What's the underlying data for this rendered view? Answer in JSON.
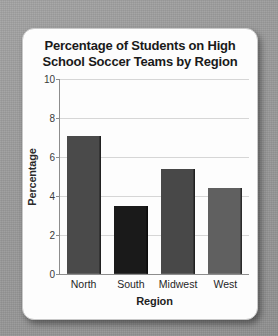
{
  "chart_data": {
    "type": "bar",
    "title": "Percentage of Students on High School Soccer Teams by Region",
    "title_lines": [
      "Percentage of Students on High",
      "School Soccer Teams by Region"
    ],
    "categories": [
      "North",
      "South",
      "Midwest",
      "West"
    ],
    "values": [
      7.1,
      3.5,
      5.4,
      4.4
    ],
    "bar_colors": [
      "#4a4a4a",
      "#1a1a1a",
      "#484848",
      "#606060"
    ],
    "xlabel": "Region",
    "ylabel": "Percentage",
    "ylim": [
      0,
      10
    ],
    "yticks": [
      0,
      2,
      4,
      6,
      8,
      10
    ],
    "ytick_labels": [
      "0",
      "2",
      "4",
      "6",
      "8",
      "10"
    ],
    "grid": true,
    "grid_axis": "y",
    "legend": null,
    "legend_position": "none"
  },
  "card": {
    "background_color": "#fdfdfd",
    "border_color": "#c9c9c9"
  },
  "page": {
    "background_color": "#9b9b9b"
  },
  "axis": {
    "line_color": "#8d8d8d",
    "grid_color": "#d6d6d6"
  }
}
